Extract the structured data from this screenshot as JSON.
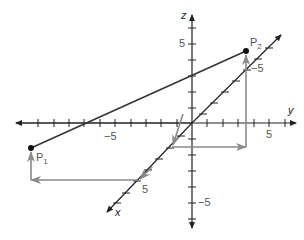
{
  "diagram": {
    "type": "3d-coordinate-system",
    "axes": {
      "x": {
        "label": "x",
        "tick_label": "5"
      },
      "y": {
        "label": "y",
        "tick_labels": [
          "−5",
          "5"
        ]
      },
      "z": {
        "label": "z",
        "tick_labels": [
          "5",
          "−5"
        ]
      },
      "x_axis_upper_label": "−5"
    },
    "points": [
      {
        "name": "P",
        "subscript": "1"
      },
      {
        "name": "P",
        "subscript": "2"
      }
    ],
    "colors": {
      "axis": "#222222",
      "segment": "#333333",
      "guide": "#8a8a8a",
      "label": "#555555"
    }
  }
}
